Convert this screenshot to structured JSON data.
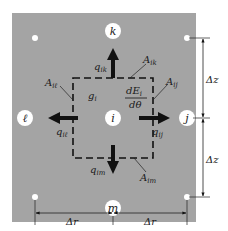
{
  "diagram": {
    "colors": {
      "panel": "#a4a4a4",
      "background": "#ffffff",
      "ink": "#111111",
      "node_fill": "#ffffff"
    },
    "nodes": {
      "k": "k",
      "l": "ℓ",
      "i": "i",
      "j": "j",
      "m": "m"
    },
    "fluxes": {
      "ik": {
        "symbol": "q",
        "sub": "ik"
      },
      "il": {
        "symbol": "q",
        "sub": "iℓ"
      },
      "ij": {
        "symbol": "q",
        "sub": "ij"
      },
      "im": {
        "symbol": "q",
        "sub": "im"
      }
    },
    "areas": {
      "ik": {
        "symbol": "A",
        "sub": "ik"
      },
      "il": {
        "symbol": "A",
        "sub": "iℓ"
      },
      "ij": {
        "symbol": "A",
        "sub": "ij"
      },
      "im": {
        "symbol": "A",
        "sub": "im"
      }
    },
    "generation": {
      "symbol": "g",
      "sub": "i"
    },
    "storage": {
      "numerator": "dE",
      "num_sub": "i",
      "denominator": "dθ"
    },
    "dimensions": {
      "dz_top": "Δz",
      "dz_bottom": "Δz",
      "dr_left": "Δr",
      "dr_right": "Δr"
    }
  }
}
